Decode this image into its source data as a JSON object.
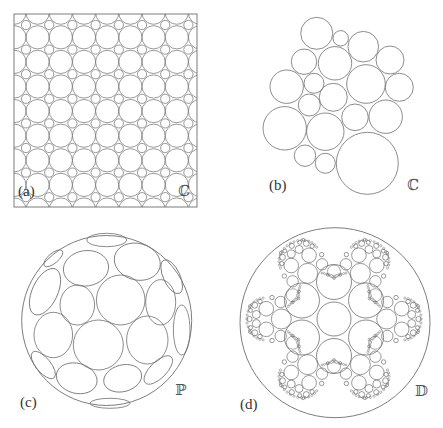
{
  "figure": {
    "stroke_color": "#6e6e6e",
    "background": "#ffffff",
    "panels": [
      {
        "id": "a",
        "label": "(a)",
        "space_symbol": "ℂ",
        "label_pos": [
          18,
          184
        ],
        "symbol_pos": [
          178,
          184
        ],
        "frame": {
          "x": 14,
          "y": 14,
          "w": 183,
          "h": 193
        },
        "grid": {
          "small_x0": 26,
          "small_dx": 23.2,
          "small_y0": 25,
          "small_dy": 24.6,
          "cols": 8,
          "rows": 8,
          "small_r": 4.6,
          "big_r": 11.6
        }
      },
      {
        "id": "b",
        "label": "(b)",
        "space_symbol": "ℂ",
        "label_pos": [
          269,
          178
        ],
        "symbol_pos": [
          407,
          178
        ],
        "circles": [
          [
            316.7,
            33.3,
            16
          ],
          [
            340.7,
            38.3,
            7.7
          ],
          [
            363.3,
            46.7,
            15.3
          ],
          [
            304,
            61.7,
            12.7
          ],
          [
            335,
            63.3,
            16.7
          ],
          [
            390,
            60,
            14
          ],
          [
            286.7,
            86.7,
            16.7
          ],
          [
            314,
            83.3,
            10
          ],
          [
            366,
            84,
            19.3
          ],
          [
            399.3,
            87.3,
            14
          ],
          [
            333.3,
            97.3,
            14
          ],
          [
            309.3,
            105,
            11
          ],
          [
            355,
            117.3,
            13.3
          ],
          [
            385.7,
            116.7,
            16.7
          ],
          [
            284.7,
            128.3,
            21.7
          ],
          [
            325.3,
            131.7,
            18.7
          ],
          [
            305,
            155.7,
            10.7
          ],
          [
            325.3,
            163.3,
            10
          ],
          [
            367.3,
            163.3,
            31
          ]
        ]
      },
      {
        "id": "c",
        "label": "(c)",
        "space_symbol": "ℙ",
        "label_pos": [
          20,
          395
        ],
        "symbol_pos": [
          175,
          383
        ],
        "outer": [
          106.7,
          320.5,
          85
        ],
        "ellipses": [
          [
            120.7,
            300,
            24.3,
            25,
            0
          ],
          [
            77.3,
            305,
            17.3,
            20,
            0
          ],
          [
            160.7,
            302.3,
            15,
            22.7,
            0
          ],
          [
            86,
            268.3,
            22.7,
            17.7,
            -8
          ],
          [
            137.3,
            261.7,
            23.3,
            18.3,
            15
          ],
          [
            98.3,
            345,
            25,
            25,
            0
          ],
          [
            147.3,
            340,
            20.7,
            24,
            0
          ],
          [
            53.3,
            335,
            19.3,
            22.7,
            0
          ],
          [
            45,
            291.7,
            12.7,
            25,
            25
          ],
          [
            106.7,
            240,
            20,
            6.7,
            0
          ],
          [
            171.7,
            276.7,
            8.3,
            18.3,
            -25
          ],
          [
            181.7,
            330,
            8.3,
            25,
            0
          ],
          [
            76.7,
            378.3,
            20.7,
            15,
            15
          ],
          [
            122.7,
            378.3,
            19.3,
            13.3,
            -15
          ],
          [
            43.3,
            365,
            7.3,
            16.7,
            -40
          ],
          [
            158.3,
            370,
            8.3,
            18.3,
            45
          ],
          [
            110,
            403.3,
            20,
            5,
            0
          ],
          [
            53.3,
            258.3,
            11.7,
            5,
            -40
          ]
        ]
      },
      {
        "id": "d",
        "label": "(d)",
        "space_symbol": "𝔻",
        "label_pos": [
          240,
          397
        ],
        "symbol_pos": [
          415,
          384
        ],
        "outer": [
          335,
          322.7,
          95
        ],
        "center": [
          334,
          319
        ],
        "hex": {
          "center_r": 17,
          "ring_dist": 37,
          "ring_r": 17.5,
          "ring_angles": [
            30,
            90,
            150,
            210,
            270,
            330
          ]
        },
        "petal_angles": [
          0,
          60,
          120,
          180,
          240,
          300
        ],
        "petal_template": [
          [
            52.7,
            0,
            10
          ],
          [
            67.7,
            10.3,
            7.3
          ],
          [
            67.7,
            -10.3,
            7.3
          ],
          [
            53.3,
            17,
            5.7
          ],
          [
            53.3,
            -17,
            5.7
          ],
          [
            77.7,
            4.5,
            4
          ],
          [
            77.7,
            -4.5,
            4
          ],
          [
            79.3,
            13.8,
            3
          ],
          [
            79.3,
            -13.8,
            3
          ],
          [
            84.5,
            0,
            2.6
          ],
          [
            74,
            17.5,
            2.2
          ],
          [
            74,
            -17.5,
            2.2
          ],
          [
            83.5,
            8.6,
            2
          ],
          [
            83.5,
            -8.6,
            2
          ],
          [
            62,
            21.5,
            2.2
          ],
          [
            62,
            -21.5,
            2.2
          ],
          [
            84,
            13,
            1.4
          ],
          [
            84,
            -13,
            1.4
          ]
        ],
        "neck_template": [
          [
            47.5,
            0,
            6.5
          ],
          [
            41,
            0,
            1.4
          ],
          [
            44,
            6.2,
            1.4
          ],
          [
            44,
            -6.2,
            1.4
          ]
        ]
      }
    ]
  }
}
